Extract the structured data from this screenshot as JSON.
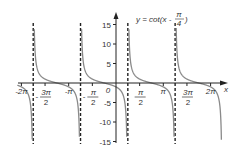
{
  "chart_data": {
    "type": "line",
    "title_parts": {
      "lhs": "y = cot(x - ",
      "num": "π",
      "den": "4",
      "close": ")"
    },
    "xlabel": "x",
    "ylabel": "",
    "function": "cot(x - pi/4)",
    "xlim": [
      -6.5,
      7.0
    ],
    "ylim": [
      -15,
      15
    ],
    "grid": false,
    "legend": "none",
    "asymptotes_x": [
      "-7π/4",
      "-3π/4",
      "π/4",
      "5π/4"
    ],
    "asymptotes_x_values": [
      -5.4978,
      -2.3562,
      0.7854,
      3.927
    ],
    "x_ticks": [
      {
        "value": -6.2832,
        "label": "-2π"
      },
      {
        "value": -4.7124,
        "label_num": "3π",
        "label_den": "2",
        "label": "-3π/2"
      },
      {
        "value": -3.1416,
        "label": "-π"
      },
      {
        "value": -1.5708,
        "label_num": "π",
        "label_den": "2",
        "label": "-π/2"
      },
      {
        "value": 1.5708,
        "label_num": "π",
        "label_den": "2",
        "label": "π/2"
      },
      {
        "value": 3.1416,
        "label": "π"
      },
      {
        "value": 4.7124,
        "label_num": "3π",
        "label_den": "2",
        "label": "3π/2"
      },
      {
        "value": 6.2832,
        "label": "2π"
      }
    ],
    "y_ticks": [
      15,
      10,
      5,
      -5,
      -10,
      -15
    ],
    "origin_label": "0",
    "series": [
      {
        "name": "y = cot(x - π/4)",
        "color": "#888888"
      }
    ]
  }
}
